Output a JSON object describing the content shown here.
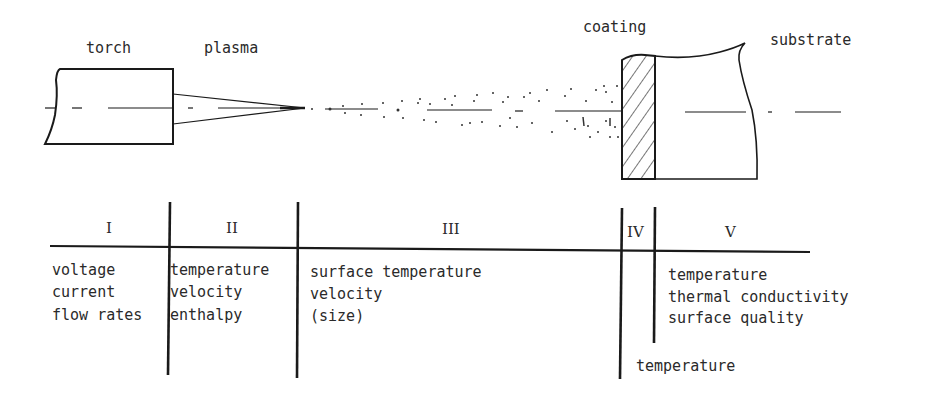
{
  "diagram": {
    "labels": {
      "torch": "torch",
      "plasma": "plasma",
      "coating": "coating",
      "substrate": "substrate"
    },
    "zones": [
      {
        "id": "I",
        "parameters": [
          "voltage",
          "current",
          "flow rates"
        ]
      },
      {
        "id": "II",
        "parameters": [
          "temperature",
          "velocity",
          "enthalpy"
        ]
      },
      {
        "id": "III",
        "parameters": [
          "surface temperature",
          "velocity",
          "(size)"
        ]
      },
      {
        "id": "IV",
        "parameters": [
          "temperature"
        ]
      },
      {
        "id": "V",
        "parameters": [
          "temperature",
          "thermal conductivity",
          "surface quality"
        ]
      }
    ],
    "colors": {
      "ink": "#1a1a1a",
      "background": "#ffffff"
    }
  }
}
